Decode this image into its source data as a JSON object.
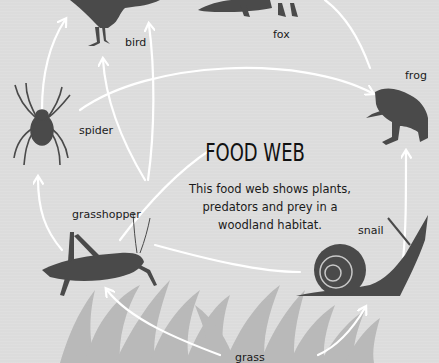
{
  "title": "FOOD WEB",
  "description": "This food web shows plants, predators and prey in a woodland habitat.",
  "organisms": {
    "bird": "bird",
    "fox": "fox",
    "frog": "frog",
    "spider": "spider",
    "grasshopper": "grasshopper",
    "snail": "snail",
    "grass": "grass"
  },
  "links": [
    {
      "from": "spider",
      "to": "bird"
    },
    {
      "from": "spider",
      "to": "frog"
    },
    {
      "from": "grasshopper",
      "to": "spider"
    },
    {
      "from": "grasshopper",
      "to": "bird"
    },
    {
      "from": "grasshopper",
      "to": "fox"
    },
    {
      "from": "snail",
      "to": "bird"
    },
    {
      "from": "snail",
      "to": "frog"
    },
    {
      "from": "frog",
      "to": "fox"
    },
    {
      "from": "grass",
      "to": "grasshopper"
    },
    {
      "from": "grass",
      "to": "snail"
    }
  ],
  "colors": {
    "background": "#dcdcdc",
    "silhouette": "#4a4a4a",
    "grass": "#b8b8b8",
    "arrow": "#ffffff",
    "text": "#1a1a1a"
  }
}
